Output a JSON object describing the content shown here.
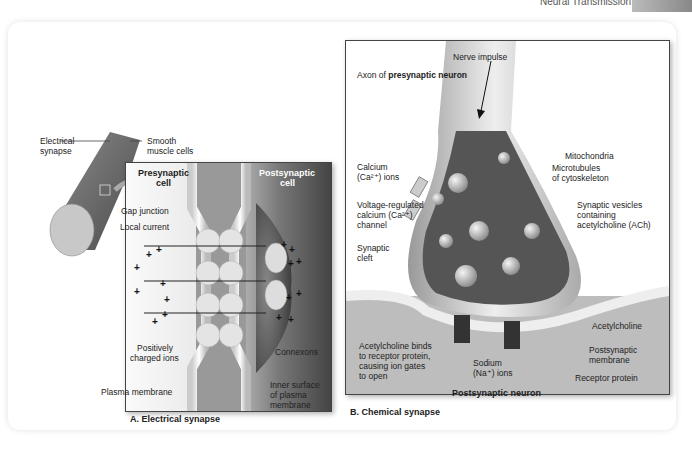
{
  "header": {
    "section_title": "Neural Transmission"
  },
  "panel_a": {
    "caption": "A. Electrical synapse",
    "labels": {
      "electrical_synapse": "Electrical\nsynapse",
      "electrical_synapse_l1": "Electrical",
      "electrical_synapse_l2": "synapse",
      "smooth_muscle_l1": "Smooth",
      "smooth_muscle_l2": "muscle cells",
      "presynaptic_l1": "Presynaptic",
      "presynaptic_l2": "cell",
      "postsynaptic_l1": "Postsynaptic",
      "postsynaptic_l2": "cell",
      "gap_junction": "Gap junction",
      "local_current": "Local current",
      "positive_ions_l1": "Positively",
      "positive_ions_l2": "charged ions",
      "connexons": "Connexons",
      "plasma_membrane": "Plasma membrane",
      "inner_surface_l1": "Inner surface",
      "inner_surface_l2": "of plasma",
      "inner_surface_l3": "membrane"
    },
    "ion_symbol": "+"
  },
  "panel_b": {
    "caption": "B. Chemical synapse",
    "labels": {
      "nerve_impulse": "Nerve impulse",
      "axon_prefix": "Axon of ",
      "axon_bold": "presynaptic neuron",
      "mitochondria": "Mitochondria",
      "calcium_l1": "Calcium",
      "calcium_l2": "(Ca²⁺) ions",
      "microtubules_l1": "Microtubules",
      "microtubules_l2": "of cytoskeleton",
      "vg_channel_l1": "Voltage-regulated",
      "vg_channel_l2": "calcium (Ca²⁺)",
      "vg_channel_l3": "channel",
      "vesicles_l1": "Synaptic vesicles",
      "vesicles_l2": "containing",
      "vesicles_l3": "acetylcholine (ACh)",
      "cleft_l1": "Synaptic",
      "cleft_l2": "cleft",
      "acetylcholine": "Acetylcholine",
      "binds_l1": "Acetylcholine binds",
      "binds_l2": "to receptor protein,",
      "binds_l3": "causing ion gates",
      "binds_l4": "to open",
      "postsyn_membrane_l1": "Postsynaptic",
      "postsyn_membrane_l2": "membrane",
      "sodium_l1": "Sodium",
      "sodium_l2": "(Na⁺) ions",
      "receptor_protein": "Receptor protein",
      "postsynaptic_neuron": "Postsynaptic neuron"
    }
  }
}
